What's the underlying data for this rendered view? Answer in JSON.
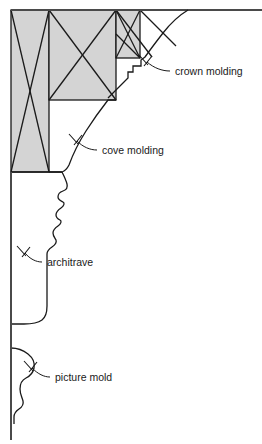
{
  "diagram": {
    "type": "architectural-section",
    "background_color": "#ffffff",
    "line_color": "#1a1a1a",
    "hatch_fill_color": "#d4d4d4",
    "labels": [
      {
        "id": "crown-molding",
        "text": "crown molding",
        "text_x": 175,
        "text_y": 75,
        "leader_from_x": 170,
        "leader_from_y": 71,
        "leader_to_x": 150,
        "leader_to_y": 64,
        "arrow_x": 145,
        "arrow_y": 61
      },
      {
        "id": "cove-molding",
        "text": "cove molding",
        "text_x": 102,
        "text_y": 154,
        "leader_from_x": 97,
        "leader_from_y": 150,
        "leader_to_x": 79,
        "leader_to_y": 142,
        "arrow_x": 74,
        "arrow_y": 139
      },
      {
        "id": "architrave",
        "text": "architrave",
        "text_x": 47,
        "text_y": 266,
        "leader_from_x": 42,
        "leader_from_y": 262,
        "leader_to_x": 27,
        "leader_to_y": 254,
        "arrow_x": 22,
        "arrow_y": 250
      },
      {
        "id": "picture-mold",
        "text": "picture mold",
        "text_x": 55,
        "text_y": 381,
        "leader_from_x": 50,
        "leader_from_y": 377,
        "leader_to_x": 33,
        "leader_to_y": 370,
        "arrow_x": 28,
        "arrow_y": 367
      }
    ],
    "structure": {
      "ceiling_line": {
        "x1": 11,
        "y1": 10,
        "x2": 262,
        "y2": 10
      },
      "wall_line": {
        "x1": 11,
        "y1": 172,
        "x2": 11,
        "y2": 440
      },
      "framing_boxes": [
        {
          "id": "stud-left",
          "x": 11,
          "y": 10,
          "width": 38,
          "height": 162,
          "hatch": "cross"
        },
        {
          "id": "joist-middle",
          "x": 49,
          "y": 10,
          "width": 67,
          "height": 90,
          "hatch": "cross"
        },
        {
          "id": "joist-right",
          "x": 116,
          "y": 10,
          "width": 24,
          "height": 48,
          "hatch": "cross"
        }
      ]
    },
    "elements": [
      {
        "id": "crown-molding",
        "name": "crown molding",
        "description": "ogee profile spanning ceiling to wall at top corner"
      },
      {
        "id": "cove-molding",
        "name": "cove molding",
        "description": "concave sweep below crown"
      },
      {
        "id": "architrave",
        "name": "architrave",
        "description": "stepped vertical trim band on wall"
      },
      {
        "id": "picture-mold",
        "name": "picture mold",
        "description": "small bulbous rail lower on wall"
      }
    ]
  }
}
